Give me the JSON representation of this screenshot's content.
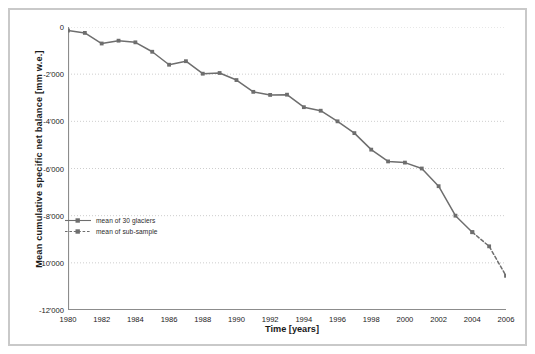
{
  "chart_data": {
    "type": "line",
    "title": "",
    "xlabel": "Time [years]",
    "ylabel": "Mean cumulative specific net balance  [mm w.e.]",
    "xlim": [
      1980,
      2006
    ],
    "ylim": [
      -12000,
      0
    ],
    "grid": true,
    "grid_axis": "y",
    "legend_position": "center-left",
    "x": [
      1980,
      1981,
      1982,
      1983,
      1984,
      1985,
      1986,
      1987,
      1988,
      1989,
      1990,
      1991,
      1992,
      1993,
      1994,
      1995,
      1996,
      1997,
      1998,
      1999,
      2000,
      2001,
      2002,
      2003,
      2004,
      2005,
      2006
    ],
    "series": [
      {
        "name": "mean of 30 glaciers",
        "style": "solid",
        "marker": "square",
        "color": "#6e6e6e",
        "x": [
          1980,
          1981,
          1982,
          1983,
          1984,
          1985,
          1986,
          1987,
          1988,
          1989,
          1990,
          1991,
          1992,
          1993,
          1994,
          1995,
          1996,
          1997,
          1998,
          1999,
          2000,
          2001,
          2002,
          2003,
          2004
        ],
        "values": [
          -150,
          -250,
          -700,
          -580,
          -650,
          -1050,
          -1600,
          -1450,
          -1980,
          -1950,
          -2250,
          -2750,
          -2880,
          -2870,
          -3400,
          -3550,
          -4000,
          -4500,
          -5200,
          -5700,
          -5750,
          -6000,
          -6750,
          -8000,
          -8700
        ]
      },
      {
        "name": "mean of sub-sample",
        "style": "dashed",
        "marker": "square",
        "color": "#6e6e6e",
        "x": [
          2004,
          2005,
          2006
        ],
        "values": [
          -8700,
          -9300,
          -10550
        ]
      }
    ],
    "yticks": [
      0,
      -2000,
      -4000,
      -6000,
      -8000,
      -10000,
      -12000
    ],
    "ytick_labels": [
      "0",
      "-2'000",
      "-4'000",
      "-6'000",
      "-8'000",
      "-10'000",
      "-12'000"
    ],
    "xticks": [
      1980,
      1982,
      1984,
      1986,
      1988,
      1990,
      1992,
      1994,
      1996,
      1998,
      2000,
      2002,
      2004,
      2006
    ],
    "xtick_labels": [
      "1980",
      "1982",
      "1984",
      "1986",
      "1988",
      "1990",
      "1992",
      "1994",
      "1996",
      "1998",
      "2000",
      "2002",
      "2004",
      "2006"
    ],
    "colors": {
      "line": "#6e6e6e",
      "axis": "#8c8c8c",
      "grid": "#b9b9b9",
      "text": "#1a1a1a",
      "frame": "#c9c9c9",
      "background": "#ffffff"
    }
  },
  "legend": {
    "items": [
      {
        "label": "mean of 30 glaciers",
        "style": "solid"
      },
      {
        "label": "mean of sub-sample",
        "style": "dashed"
      }
    ]
  }
}
